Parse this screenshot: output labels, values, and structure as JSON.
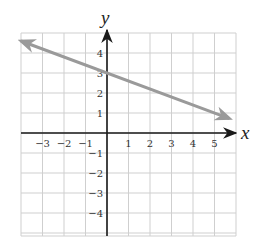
{
  "chart_data": {
    "type": "line",
    "title": "",
    "xlabel": "x",
    "ylabel": "y",
    "xlim": [
      -4,
      6
    ],
    "ylim": [
      -5,
      5
    ],
    "grid": true,
    "x_ticks": [
      "-3",
      "-2",
      "-1",
      "1",
      "2",
      "3",
      "4",
      "5"
    ],
    "y_ticks": [
      "4",
      "3",
      "2",
      "1",
      "-1",
      "-2",
      "-3",
      "-4"
    ],
    "series": [
      {
        "name": "line",
        "color": "#9a9a9a",
        "equation": "y = -0.4x + 3",
        "x": [
          -4,
          5.7
        ],
        "y": [
          4.6,
          0.72
        ],
        "arrows": "both"
      }
    ]
  },
  "labels": {
    "x_axis": "x",
    "y_axis": "y"
  }
}
